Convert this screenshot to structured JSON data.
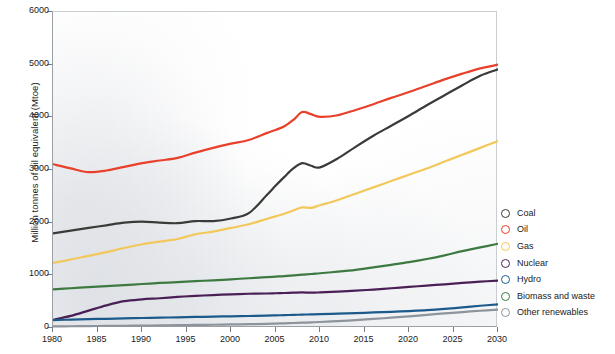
{
  "axes": {
    "ylabel": "Million tonnes of oil equivalent (Mtoe)",
    "xlabel": "",
    "yticks": [
      "0",
      "1000",
      "2000",
      "3000",
      "4000",
      "5000",
      "6000"
    ],
    "xticks": [
      "1980",
      "1985",
      "1990",
      "1995",
      "2000",
      "2005",
      "2010",
      "2015",
      "2020",
      "2025",
      "2030"
    ]
  },
  "legend": {
    "items": [
      {
        "label": "Coal",
        "color": "#3a3a38"
      },
      {
        "label": "Oil",
        "color": "#e8402a"
      },
      {
        "label": "Gas",
        "color": "#f2c85b"
      },
      {
        "label": "Nuclear",
        "color": "#4a1f56"
      },
      {
        "label": "Hydro",
        "color": "#1c5a8c"
      },
      {
        "label": "Biomass and waste",
        "color": "#3d7a42"
      },
      {
        "label": "Other renewables",
        "color": "#8d949b"
      }
    ]
  },
  "caption": {
    "text": ""
  },
  "chart_data": {
    "type": "line",
    "title": "",
    "xlabel": "",
    "ylabel": "Million tonnes of oil equivalent (Mtoe)",
    "xlim": [
      1980,
      2030
    ],
    "ylim": [
      0,
      6000
    ],
    "ytick_step": 1000,
    "xtick_step": 5,
    "grid": false,
    "legend_position": "right",
    "x": [
      1980,
      1982,
      1984,
      1986,
      1988,
      1990,
      1992,
      1994,
      1996,
      1998,
      2000,
      2002,
      2004,
      2005,
      2006,
      2007,
      2008,
      2009,
      2010,
      2012,
      2014,
      2016,
      2018,
      2020,
      2022,
      2024,
      2026,
      2028,
      2030
    ],
    "series": [
      {
        "name": "Coal",
        "color": "#3a3a38",
        "values": [
          1795,
          1850,
          1900,
          1950,
          2000,
          2020,
          2000,
          1990,
          2030,
          2030,
          2080,
          2180,
          2520,
          2700,
          2870,
          3030,
          3130,
          3080,
          3050,
          3220,
          3440,
          3650,
          3840,
          4030,
          4230,
          4420,
          4610,
          4790,
          4910
        ]
      },
      {
        "name": "Oil",
        "color": "#e8402a",
        "values": [
          3110,
          3030,
          2960,
          2990,
          3060,
          3130,
          3180,
          3230,
          3330,
          3420,
          3500,
          3570,
          3700,
          3760,
          3830,
          3950,
          4100,
          4060,
          4010,
          4040,
          4140,
          4250,
          4370,
          4480,
          4600,
          4720,
          4830,
          4930,
          5000
        ]
      },
      {
        "name": "Gas",
        "color": "#f2c85b",
        "values": [
          1235,
          1300,
          1370,
          1440,
          1520,
          1590,
          1640,
          1690,
          1780,
          1830,
          1900,
          1970,
          2070,
          2120,
          2170,
          2230,
          2290,
          2280,
          2330,
          2430,
          2550,
          2670,
          2790,
          2910,
          3030,
          3160,
          3290,
          3420,
          3550
        ]
      },
      {
        "name": "Nuclear",
        "color": "#4a1f56",
        "values": [
          155,
          230,
          330,
          430,
          510,
          545,
          565,
          590,
          610,
          625,
          640,
          650,
          655,
          660,
          665,
          670,
          675,
          670,
          675,
          690,
          710,
          730,
          755,
          780,
          805,
          830,
          855,
          880,
          900
        ]
      },
      {
        "name": "Hydro",
        "color": "#1c5a8c",
        "values": [
          150,
          160,
          168,
          175,
          182,
          190,
          196,
          202,
          210,
          216,
          222,
          228,
          236,
          240,
          244,
          249,
          254,
          258,
          262,
          272,
          283,
          295,
          308,
          322,
          338,
          362,
          392,
          422,
          450
        ]
      },
      {
        "name": "Biomass and waste",
        "color": "#3d7a42",
        "values": [
          735,
          755,
          775,
          795,
          815,
          835,
          855,
          870,
          890,
          905,
          925,
          945,
          965,
          975,
          985,
          1000,
          1015,
          1025,
          1040,
          1070,
          1105,
          1150,
          1200,
          1250,
          1310,
          1380,
          1460,
          1530,
          1600
        ]
      },
      {
        "name": "Other renewables",
        "color": "#8d949b",
        "values": [
          30,
          33,
          36,
          39,
          42,
          46,
          50,
          54,
          58,
          62,
          67,
          73,
          80,
          84,
          89,
          95,
          101,
          107,
          114,
          130,
          150,
          172,
          196,
          222,
          250,
          278,
          303,
          328,
          350
        ]
      }
    ]
  }
}
